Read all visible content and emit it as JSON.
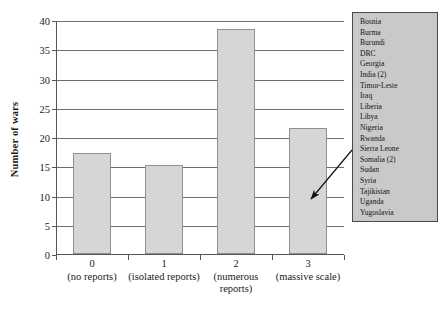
{
  "chart_data": {
    "type": "bar",
    "title": "",
    "xlabel": "",
    "ylabel": "Number of wars",
    "ylim": [
      0,
      40
    ],
    "yticks": [
      0,
      5,
      10,
      15,
      20,
      25,
      30,
      35,
      40
    ],
    "grid": true,
    "legend_position": "right",
    "categories": [
      "0",
      "1",
      "2",
      "3"
    ],
    "category_descriptions": [
      "(no reports)",
      "(isolated reports)",
      "(numerous reports)",
      "(massive scale)"
    ],
    "values": [
      17.2,
      15.2,
      38.5,
      21.5
    ],
    "bar_color": "#d6d6d6",
    "bar_edge_color": "#8f8f8f",
    "annotation": {
      "type": "arrow",
      "points_to_category": "3",
      "description": "arrow from country list to bar 3"
    }
  },
  "legend": {
    "background_color": "#c9c9c9",
    "items": [
      "Bosnia",
      "Burma",
      "Burundi",
      "DRC",
      "Georgia",
      "India (2)",
      "Timor-Leste",
      "Iraq",
      "Liberia",
      "Libya",
      "Nigeria",
      "Rwanda",
      "Sierra Leone",
      "Somalia (2)",
      "Sudan",
      "Syria",
      "Tajikistan",
      "Uganda",
      "Yugoslavia"
    ]
  }
}
